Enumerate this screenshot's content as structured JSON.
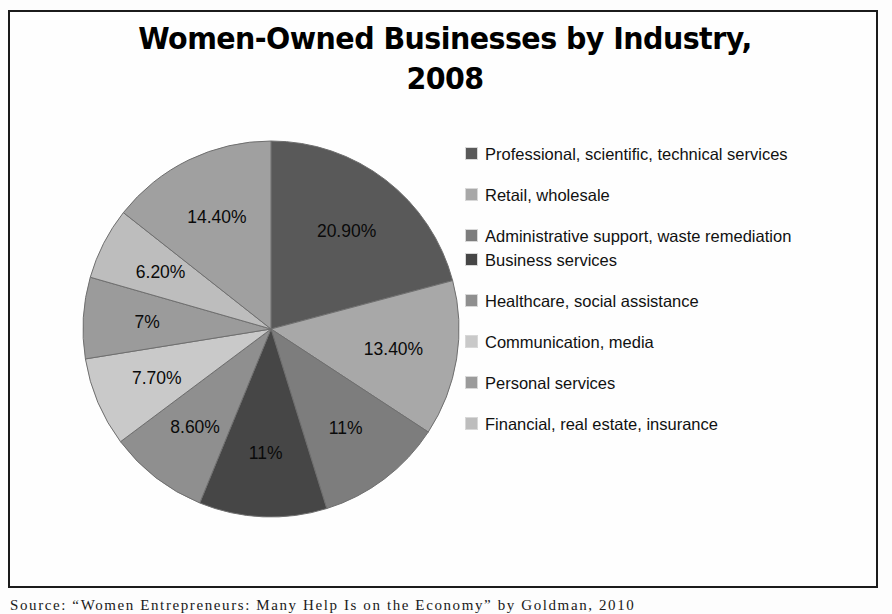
{
  "chart_data": {
    "type": "pie",
    "title": "Women-Owned Businesses by Industry,\n2008",
    "xlabel": "",
    "ylabel": "",
    "legend_position": "right",
    "grid": false,
    "categories": [
      "Professional, scientific, technical services",
      "Retail, wholesale",
      "Administrative support, waste remediation",
      "Business services",
      "Healthcare, social assistance",
      "Communication, media",
      "Personal services",
      "Financial, real estate, insurance",
      ""
    ],
    "values": [
      20.9,
      13.4,
      11,
      11,
      8.6,
      7.7,
      7,
      6.2,
      14.4
    ],
    "value_labels": [
      "20.90%",
      "13.40%",
      "11%",
      "11%",
      "8.60%",
      "7.70%",
      "7%",
      "6.20%",
      "14.40%"
    ],
    "colors": [
      "#595959",
      "#a8a8a8",
      "#7d7d7d",
      "#464646",
      "#8f8f8f",
      "#c9c9c9",
      "#9b9b9b",
      "#bdbdbd",
      "#a0a0a0"
    ],
    "units": "percent"
  },
  "legend": {
    "items": [
      {
        "label": "Professional, scientific, technical services",
        "color": "#595959"
      },
      {
        "label": "Retail, wholesale",
        "color": "#a8a8a8"
      },
      {
        "label": "Administrative support, waste remediation",
        "color": "#7d7d7d"
      },
      {
        "label": "Business services",
        "color": "#464646"
      },
      {
        "label": "Healthcare, social assistance",
        "color": "#8f8f8f"
      },
      {
        "label": "Communication, media",
        "color": "#c9c9c9"
      },
      {
        "label": "Personal services",
        "color": "#9b9b9b"
      },
      {
        "label": "Financial, real estate, insurance",
        "color": "#bdbdbd"
      }
    ]
  },
  "source": {
    "text": "Source:  “Women  Entrepreneurs:  Many  Help  Is  on  the  Economy”  by  Goldman,  2010"
  },
  "style": {
    "frame_color": "#1b1b1b",
    "background": "#fefefe",
    "label_color": "#0a0a0a"
  }
}
